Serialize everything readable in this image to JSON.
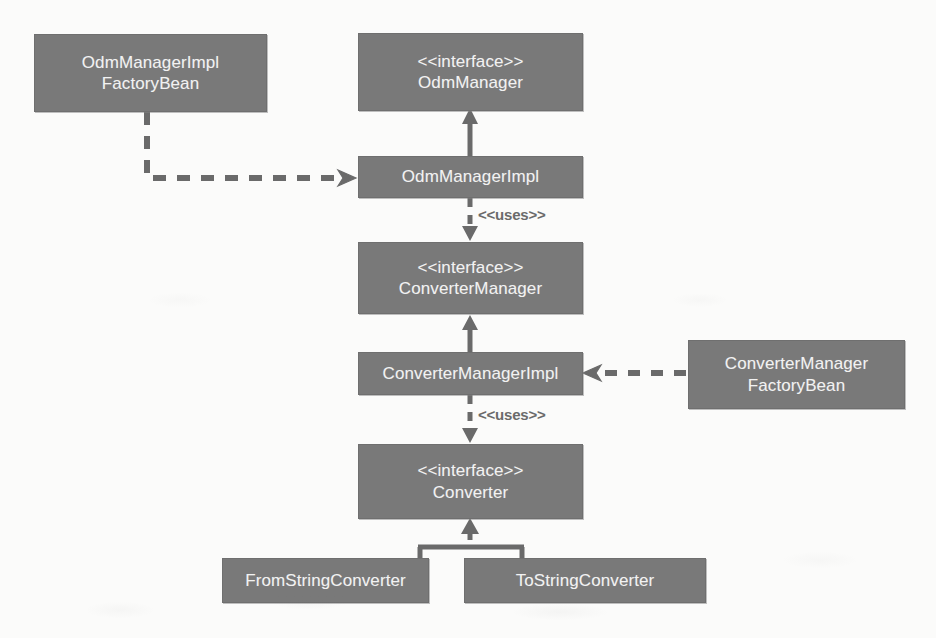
{
  "diagram": {
    "kind": "uml-class-diagram",
    "colors": {
      "node_fill": "#797979",
      "node_border": "#6f6f6f",
      "node_text": "#f2f2f2",
      "edge": "#6a6a6a",
      "background": "#fbfbfa"
    },
    "nodes": [
      {
        "id": "odm-manager-impl-factory-bean",
        "name": "odm-manager-impl-factory-bean",
        "label": "OdmManagerImpl\nFactoryBean",
        "stereotype": "",
        "x": 34,
        "y": 34,
        "w": 233,
        "h": 78,
        "font_size": 17
      },
      {
        "id": "odm-manager-interface",
        "name": "odm-manager-interface",
        "label": "<<interface>>\nOdmManager",
        "stereotype": "interface",
        "x": 358,
        "y": 33,
        "w": 225,
        "h": 78,
        "font_size": 17
      },
      {
        "id": "odm-manager-impl",
        "name": "odm-manager-impl",
        "label": "OdmManagerImpl",
        "stereotype": "",
        "x": 358,
        "y": 156,
        "w": 225,
        "h": 42,
        "font_size": 17
      },
      {
        "id": "converter-manager-interface",
        "name": "converter-manager-interface",
        "label": "<<interface>>\nConverterManager",
        "stereotype": "interface",
        "x": 358,
        "y": 242,
        "w": 225,
        "h": 72,
        "font_size": 17
      },
      {
        "id": "converter-manager-impl",
        "name": "converter-manager-impl",
        "label": "ConverterManagerImpl",
        "stereotype": "",
        "x": 358,
        "y": 352,
        "w": 225,
        "h": 43,
        "font_size": 17
      },
      {
        "id": "converter-manager-factory-bean",
        "name": "converter-manager-factory-bean",
        "label": "ConverterManager\nFactoryBean",
        "stereotype": "",
        "x": 688,
        "y": 340,
        "w": 217,
        "h": 69,
        "font_size": 17
      },
      {
        "id": "converter-interface",
        "name": "converter-interface",
        "label": "<<interface>>\nConverter",
        "stereotype": "interface",
        "x": 358,
        "y": 444,
        "w": 225,
        "h": 75,
        "font_size": 17
      },
      {
        "id": "from-string-converter",
        "name": "from-string-converter",
        "label": "FromStringConverter",
        "stereotype": "",
        "x": 222,
        "y": 558,
        "w": 207,
        "h": 45,
        "font_size": 17
      },
      {
        "id": "to-string-converter",
        "name": "to-string-converter",
        "label": "ToStringConverter",
        "stereotype": "",
        "x": 464,
        "y": 558,
        "w": 242,
        "h": 45,
        "font_size": 17
      }
    ],
    "edges": [
      {
        "id": "edge-factorybean-creates-odmmanagerimpl",
        "name": "dependency-odm-factory-bean-to-odm-manager-impl",
        "from": "odm-manager-impl-factory-bean",
        "to": "odm-manager-impl",
        "style": "dashed",
        "arrow": "open",
        "label": ""
      },
      {
        "id": "edge-odmmanagerimpl-realizes-odmmanager",
        "name": "realization-odm-manager-impl-to-odm-manager",
        "from": "odm-manager-impl",
        "to": "odm-manager-interface",
        "style": "solid",
        "arrow": "filled",
        "label": ""
      },
      {
        "id": "edge-odmmanagerimpl-uses-convertermanager",
        "name": "dependency-odm-manager-impl-to-converter-manager",
        "from": "odm-manager-impl",
        "to": "converter-manager-interface",
        "style": "dashed",
        "arrow": "filled",
        "label": "<<uses>>"
      },
      {
        "id": "edge-convertermanagerimpl-realizes-convertermanager",
        "name": "realization-converter-manager-impl-to-converter-manager",
        "from": "converter-manager-impl",
        "to": "converter-manager-interface",
        "style": "solid",
        "arrow": "filled",
        "label": ""
      },
      {
        "id": "edge-converterfactorybean-creates-convertermanagerimpl",
        "name": "dependency-converter-factory-bean-to-converter-manager-impl",
        "from": "converter-manager-factory-bean",
        "to": "converter-manager-impl",
        "style": "dashed",
        "arrow": "open",
        "label": ""
      },
      {
        "id": "edge-convertermanagerimpl-uses-converter",
        "name": "dependency-converter-manager-impl-to-converter",
        "from": "converter-manager-impl",
        "to": "converter-interface",
        "style": "dashed",
        "arrow": "filled",
        "label": "<<uses>>"
      },
      {
        "id": "edge-fromstringconverter-realizes-converter",
        "name": "realization-from-string-converter-to-converter",
        "from": "from-string-converter",
        "to": "converter-interface",
        "style": "solid",
        "arrow": "filled",
        "label": ""
      },
      {
        "id": "edge-tostringconverter-realizes-converter",
        "name": "realization-to-string-converter-to-converter",
        "from": "to-string-converter",
        "to": "converter-interface",
        "style": "solid",
        "arrow": "filled",
        "label": ""
      }
    ],
    "edge_labels": [
      {
        "id": "uses-label-1",
        "name": "uses-label-odm-to-converter-manager",
        "text": "<<uses>>",
        "x": 478,
        "y": 206
      },
      {
        "id": "uses-label-2",
        "name": "uses-label-converter-manager-to-converter",
        "text": "<<uses>>",
        "x": 478,
        "y": 406
      }
    ]
  }
}
